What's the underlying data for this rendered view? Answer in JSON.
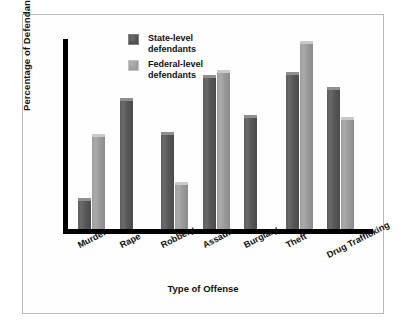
{
  "chart_data": {
    "type": "bar",
    "title": "",
    "xlabel": "Type of Offense",
    "ylabel": "Percentage of Defendants Released",
    "categories": [
      "Murder",
      "Rape",
      "Robbery",
      "Assault",
      "Burglary",
      "Theft",
      "Drug Trafficking"
    ],
    "series": [
      {
        "name": "State-level defendants",
        "color": "#5a5a5a",
        "values": [
          13,
          55,
          41,
          65,
          48,
          66,
          60
        ]
      },
      {
        "name": "Federal-level defendants",
        "color": "#a0a0a0",
        "values": [
          40,
          null,
          20,
          67,
          null,
          79,
          47
        ]
      }
    ],
    "ylim": [
      0,
      80
    ],
    "ytick_labels": [
      "80",
      "60",
      "40",
      "20",
      "10",
      "0"
    ],
    "ytick_values": [
      80,
      60,
      40,
      20,
      10,
      0
    ],
    "grid": false,
    "legend_position": "top-left-inside"
  },
  "legend": {
    "items": [
      {
        "label_line1": "State-level",
        "label_line2": "defendants",
        "swatch": "state-swatch"
      },
      {
        "label_line1": "Federal-level",
        "label_line2": "defendants",
        "swatch": "federal-swatch"
      }
    ]
  },
  "colors": {
    "state_bar": "#5a5a5a",
    "federal_bar": "#a0a0a0",
    "axis": "#000000",
    "frame": "#b9b9b9",
    "background": "#ffffff",
    "text": "#111111"
  }
}
